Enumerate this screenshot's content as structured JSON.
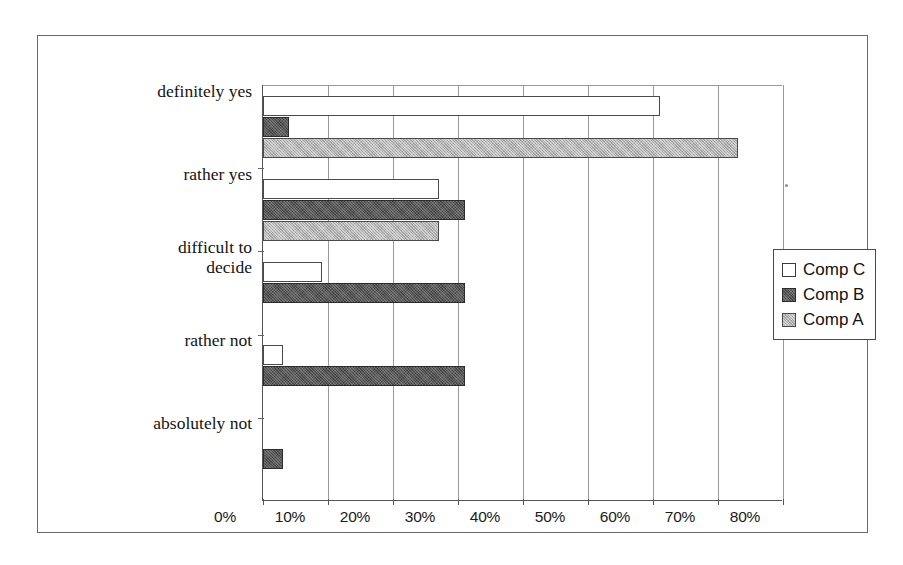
{
  "chart_data": {
    "type": "bar",
    "orientation": "horizontal",
    "title": "",
    "subtitle": "",
    "xlabel": "",
    "ylabel": "",
    "categories": [
      "definitely yes",
      "rather yes",
      "difficult to\ndecide",
      "rather not",
      "absolutely not"
    ],
    "series": [
      {
        "name": "Comp C",
        "values": [
          61,
          27,
          9,
          3,
          0
        ],
        "swatch": "white-outline",
        "color": "#ffffff"
      },
      {
        "name": "Comp B",
        "values": [
          4,
          31,
          31,
          31,
          3
        ],
        "swatch": "dark-gray",
        "color": "#585858"
      },
      {
        "name": "Comp A",
        "values": [
          73,
          27,
          0,
          0,
          0
        ],
        "swatch": "light-gray",
        "color": "#b4b4b4"
      }
    ],
    "xlim": [
      0,
      80
    ],
    "xtick_values": [
      0,
      10,
      20,
      30,
      40,
      50,
      60,
      70,
      80
    ],
    "xtick_labels": [
      "0%",
      "10%",
      "20%",
      "30%",
      "40%",
      "50%",
      "60%",
      "70%",
      "80%"
    ],
    "grid": "vertical",
    "legend_position": "right-middle",
    "value_unit": "%"
  },
  "legend": {
    "entries": [
      {
        "label": "Comp C"
      },
      {
        "label": "Comp B"
      },
      {
        "label": "Comp A"
      }
    ]
  }
}
